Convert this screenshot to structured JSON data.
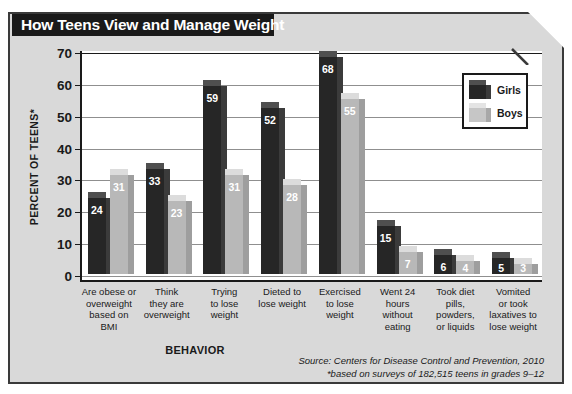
{
  "title": "How Teens View and Manage Weight",
  "colors": {
    "girls": "#262626",
    "boys": "#b8b8b8",
    "panel_bg": "#d9d9d9",
    "plot_bg": "#ffffff",
    "banner_bg": "#1a1a1a",
    "gridline": "#8f8f8f"
  },
  "legend": {
    "position": "top-right-inside-plot",
    "items": [
      {
        "label": "Girls",
        "swatch": "dark-cube-swatch"
      },
      {
        "label": "Boys",
        "swatch": "light-cube-swatch"
      }
    ]
  },
  "axes": {
    "y_title": "PERCENT OF TEENS*",
    "x_title": "BEHAVIOR",
    "y_ticks": [
      0,
      10,
      20,
      30,
      40,
      50,
      60,
      70
    ]
  },
  "footnotes": {
    "source": "Source: Centers for Disease Control and Prevention, 2010",
    "note": "*based on surveys of 182,515 teens in grades 9–12"
  },
  "chart_data": {
    "type": "bar",
    "title": "How Teens View and Manage Weight",
    "xlabel": "BEHAVIOR",
    "ylabel": "PERCENT OF TEENS*",
    "ylim": [
      0,
      70
    ],
    "yticks": [
      0,
      10,
      20,
      30,
      40,
      50,
      60,
      70
    ],
    "grid": true,
    "legend_position": "upper right",
    "categories": [
      "Are obese or overweight based on BMI",
      "Think they are overweight",
      "Trying to lose weight",
      "Dieted to lose weight",
      "Exercised to lose weight",
      "Went 24 hours without eating",
      "Took diet pills, powders, or liquids",
      "Vomited or took laxatives to lose weight"
    ],
    "category_lines": [
      [
        "Are obese or",
        "overweight",
        "based on",
        "BMI"
      ],
      [
        "Think",
        "they are",
        "overweight"
      ],
      [
        "Trying",
        "to lose",
        "weight"
      ],
      [
        "Dieted to",
        "lose weight"
      ],
      [
        "Exercised",
        "to lose",
        "weight"
      ],
      [
        "Went 24",
        "hours",
        "without",
        "eating"
      ],
      [
        "Took diet",
        "pills,",
        "powders,",
        "or liquids"
      ],
      [
        "Vomited",
        "or took",
        "laxatives to",
        "lose weight"
      ]
    ],
    "series": [
      {
        "name": "Girls",
        "values": [
          24,
          33,
          59,
          52,
          68,
          15,
          6,
          5
        ]
      },
      {
        "name": "Boys",
        "values": [
          31,
          23,
          31,
          28,
          55,
          7,
          4,
          3
        ]
      }
    ],
    "annotations": [
      "Source: Centers for Disease Control and Prevention, 2010",
      "*based on surveys of 182,515 teens in grades 9–12"
    ]
  }
}
